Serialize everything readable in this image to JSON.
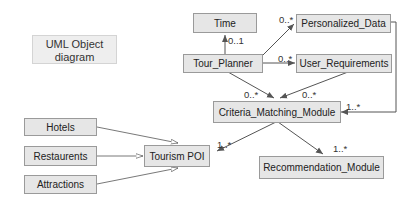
{
  "title": {
    "line1": "UML Object",
    "line2": "diagram"
  },
  "nodes": {
    "time": "Time",
    "personalized_data": "Personalized_Data",
    "tour_planner": "Tour_Planner",
    "user_requirements": "User_Requirements",
    "criteria_matching_module": "Criteria_Matching_Module",
    "hotels": "Hotels",
    "restaurents": "Restaurents",
    "attractions": "Attractions",
    "tourism_poi": "Tourism POI",
    "recommendation_module": "Recommendation_Module"
  },
  "multiplicities": {
    "tour_to_time": "0..1",
    "tour_to_personalized": "0..*",
    "tour_to_userreq": "0..*",
    "tour_to_criteria": "0..*",
    "userreq_to_criteria": "0..*",
    "personalized_to_criteria": "1..*",
    "criteria_to_poi": "1..*",
    "criteria_to_recommendation": "1..*"
  },
  "colors": {
    "node_fill": "#e6e6e6",
    "node_border": "#9a9a9a",
    "edge": "#555555"
  }
}
